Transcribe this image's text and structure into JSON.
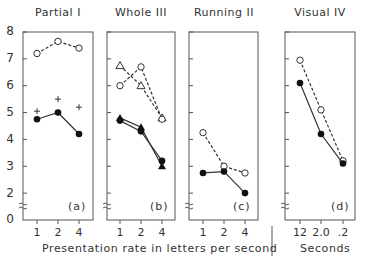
{
  "chart_data": [
    {
      "type": "line",
      "title": "Partial I",
      "panel_label": "(a)",
      "xlabel": "Presentation rate in letters per second",
      "ylabel": "",
      "categories": [
        "1",
        "2",
        "4"
      ],
      "ylim": [
        0,
        8
      ],
      "y_axis_break": true,
      "yticks": [
        "8",
        "7",
        "6",
        "5",
        "4",
        "3",
        "2",
        "0"
      ],
      "series": [
        {
          "name": "open circle (dashed)",
          "marker": "open-circle",
          "line": "dashed",
          "values": [
            7.2,
            7.65,
            7.4
          ]
        },
        {
          "name": "plus",
          "marker": "plus",
          "line": "none",
          "values": [
            5.05,
            5.5,
            5.2
          ]
        },
        {
          "name": "filled circle (solid)",
          "marker": "filled-circle",
          "line": "solid",
          "values": [
            4.75,
            5.0,
            4.2
          ]
        }
      ]
    },
    {
      "type": "line",
      "title": "Whole III",
      "panel_label": "(b)",
      "categories": [
        "1",
        "2",
        "4"
      ],
      "ylim": [
        0,
        8
      ],
      "series": [
        {
          "name": "open triangle (dashed)",
          "marker": "open-triangle",
          "line": "dashed",
          "values": [
            6.75,
            6.0,
            4.8
          ]
        },
        {
          "name": "open circle (dashed)",
          "marker": "open-circle",
          "line": "dashed",
          "values": [
            6.0,
            6.7,
            4.75
          ]
        },
        {
          "name": "filled triangle (solid)",
          "marker": "filled-triangle",
          "line": "solid",
          "values": [
            4.8,
            4.45,
            3.0
          ]
        },
        {
          "name": "filled circle (solid)",
          "marker": "filled-circle",
          "line": "solid",
          "values": [
            4.7,
            4.3,
            3.2
          ]
        }
      ]
    },
    {
      "type": "line",
      "title": "Running II",
      "panel_label": "(c)",
      "categories": [
        "1",
        "2",
        "4"
      ],
      "ylim": [
        0,
        8
      ],
      "series": [
        {
          "name": "open circle (dashed)",
          "marker": "open-circle",
          "line": "dashed",
          "values": [
            4.25,
            3.0,
            2.75
          ]
        },
        {
          "name": "filled circle (solid)",
          "marker": "filled-circle",
          "line": "solid",
          "values": [
            2.75,
            2.8,
            2.0
          ]
        }
      ]
    },
    {
      "type": "line",
      "title": "Visual IV",
      "panel_label": "(d)",
      "xlabel": "Seconds",
      "categories": [
        "12",
        "2.0",
        ".2"
      ],
      "ylim": [
        0,
        8
      ],
      "series": [
        {
          "name": "open circle (dashed)",
          "marker": "open-circle",
          "line": "dashed",
          "values": [
            6.95,
            5.1,
            3.2
          ]
        },
        {
          "name": "filled circle (solid)",
          "marker": "filled-circle",
          "line": "solid",
          "values": [
            6.1,
            4.2,
            3.1
          ]
        }
      ]
    }
  ],
  "labels": {
    "titles": [
      "Partial I",
      "Whole III",
      "Running II",
      "Visual IV"
    ],
    "panel_labels": [
      "(a)",
      "(b)",
      "(c)",
      "(d)"
    ],
    "yticks": [
      "8",
      "7",
      "6",
      "5",
      "4",
      "3",
      "2",
      "0"
    ],
    "xticks_rate": [
      "1",
      "2",
      "4"
    ],
    "xticks_seconds": [
      "12",
      "2.0",
      ".2"
    ],
    "xlabel_rate": "Presentation rate in letters per second",
    "xlabel_seconds": "Seconds"
  }
}
